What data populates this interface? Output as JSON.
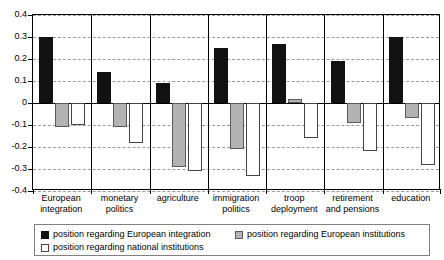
{
  "chart_data": {
    "type": "bar",
    "title": "",
    "xlabel": "",
    "ylabel": "",
    "ylim": [
      -0.4,
      0.4
    ],
    "grid": true,
    "legend_position": "bottom",
    "ytick_labels": [
      "0.4",
      "0.3",
      "0.2",
      "0.1",
      "0",
      "-0.1",
      "-0.2",
      "-0.3",
      "-0.4"
    ],
    "ytick_values": [
      0.4,
      0.3,
      0.2,
      0.1,
      0,
      -0.1,
      -0.2,
      -0.3,
      -0.4
    ],
    "categories": [
      "European integration",
      "monetary politics",
      "agriculture",
      "immigration politics",
      "troop deployment",
      "retirement and pensions",
      "education"
    ],
    "category_lines": [
      [
        "European",
        "integration"
      ],
      [
        "monetary",
        "politics"
      ],
      [
        "agriculture",
        ""
      ],
      [
        "immigration",
        "politics"
      ],
      [
        "troop",
        "deployment"
      ],
      [
        "retirement",
        "and pensions"
      ],
      [
        "education",
        ""
      ]
    ],
    "series": [
      {
        "name": "position regarding European integration",
        "key": "black",
        "color": "#111111",
        "values": [
          0.3,
          0.14,
          0.09,
          0.25,
          0.27,
          0.19,
          0.3
        ]
      },
      {
        "name": "position regarding European institutions",
        "key": "gray",
        "color": "#b3b3b3",
        "values": [
          -0.11,
          -0.11,
          -0.29,
          -0.21,
          0.02,
          -0.09,
          -0.07
        ]
      },
      {
        "name": "position regarding national institutions",
        "key": "white",
        "color": "#ffffff",
        "values": [
          -0.1,
          -0.18,
          -0.31,
          -0.33,
          -0.16,
          -0.22,
          -0.28
        ]
      }
    ]
  },
  "legend": {
    "items": [
      {
        "label": "position regarding European integration",
        "swatch": "black"
      },
      {
        "label": "position regarding European institutions",
        "swatch": "gray"
      },
      {
        "label": "position regarding national institutions",
        "swatch": "white"
      }
    ]
  }
}
